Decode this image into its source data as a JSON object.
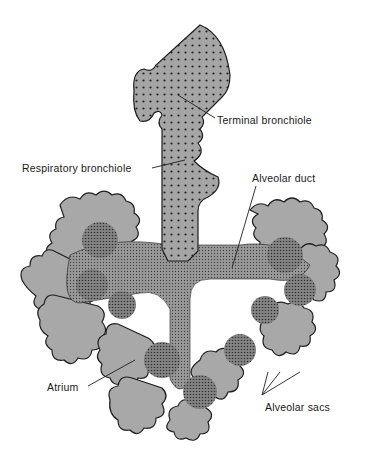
{
  "figure": {
    "labels": {
      "terminal_bronchiole": "Terminal bronchiole",
      "respiratory_bronchiole": "Respiratory bronchiole",
      "alveolar_duct": "Alveolar duct",
      "atrium": "Atrium",
      "alveolar_sacs": "Alveolar sacs"
    },
    "colors": {
      "tissue_fill": "#a8a8a8",
      "duct_fill": "#8e8e8e",
      "outline": "#1e1e1e",
      "background": "#ffffff"
    }
  }
}
